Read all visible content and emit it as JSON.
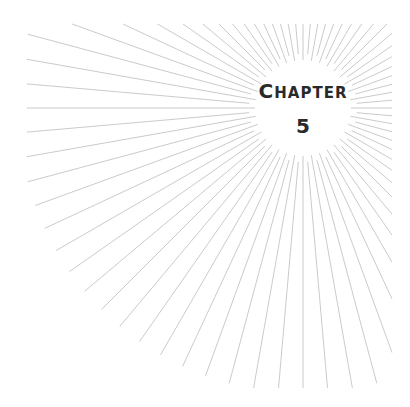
{
  "chapter": {
    "label": "Chapter",
    "number": "5",
    "text_color": "#2a2a2a"
  },
  "sunburst": {
    "center": [
      303,
      108
    ],
    "inner_radius": 48,
    "ray_count": 72,
    "ray_color": "#c4c4c4",
    "ray_width": 0.9,
    "bounds": {
      "left": 27,
      "top": 24,
      "right": 392,
      "bottom": 388,
      "outer_radius": 285
    }
  }
}
